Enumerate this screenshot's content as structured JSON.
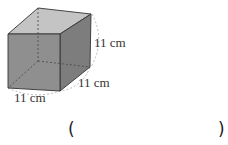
{
  "figure": {
    "type": "cube",
    "labels": {
      "height": "11 cm",
      "depth": "11 cm",
      "width": "11 cm"
    },
    "colors": {
      "front": "#8c8c8c",
      "top": "#c4c4c4",
      "side": "#7a7a7a",
      "edge": "#333333",
      "dashed": "#555555"
    }
  },
  "answer": {
    "open_paren": "(",
    "close_paren": ")"
  }
}
